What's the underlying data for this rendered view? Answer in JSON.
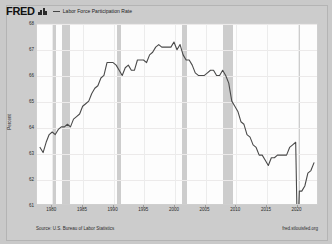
{
  "header": {
    "logo_text": "FRED",
    "logo_icon": "bar-chart-icon",
    "legend_label": "Labor Force Participation Rate"
  },
  "footer": {
    "source": "Source: U.S. Bureau of Labor Statistics",
    "url": "fred.stlouisfed.org"
  },
  "chart_data": {
    "type": "line",
    "title": "Labor Force Participation Rate",
    "xlabel": "",
    "ylabel": "Percent",
    "ylim": [
      61,
      68
    ],
    "xlim": [
      1977.5,
      2023.5
    ],
    "yticks": [
      68,
      67,
      66,
      65,
      64,
      63,
      62,
      61
    ],
    "xticks": [
      1980,
      1985,
      1990,
      1995,
      2000,
      2005,
      2010,
      2015,
      2020
    ],
    "grid": true,
    "legend_position": "top",
    "line_color": "#4a4a4a",
    "recession_color": "#c4c4c4",
    "recessions": [
      {
        "start": 1980.0,
        "end": 1980.6
      },
      {
        "start": 1981.5,
        "end": 1982.9
      },
      {
        "start": 1990.6,
        "end": 1991.2
      },
      {
        "start": 2001.2,
        "end": 2001.9
      },
      {
        "start": 2007.9,
        "end": 2009.5
      },
      {
        "start": 2020.1,
        "end": 2020.4
      }
    ],
    "x": [
      1978.0,
      1978.5,
      1979.0,
      1979.5,
      1980.0,
      1980.5,
      1981.0,
      1981.5,
      1982.0,
      1982.5,
      1983.0,
      1983.5,
      1984.0,
      1984.5,
      1985.0,
      1985.5,
      1986.0,
      1986.5,
      1987.0,
      1987.5,
      1988.0,
      1988.5,
      1989.0,
      1989.5,
      1990.0,
      1990.5,
      1991.0,
      1991.5,
      1992.0,
      1992.5,
      1993.0,
      1993.5,
      1994.0,
      1994.5,
      1995.0,
      1995.5,
      1996.0,
      1996.5,
      1997.0,
      1997.5,
      1998.0,
      1998.5,
      1999.0,
      1999.5,
      2000.0,
      2000.5,
      2001.0,
      2001.5,
      2002.0,
      2002.5,
      2003.0,
      2003.5,
      2004.0,
      2004.5,
      2005.0,
      2005.5,
      2006.0,
      2006.5,
      2007.0,
      2007.5,
      2008.0,
      2008.5,
      2009.0,
      2009.5,
      2010.0,
      2010.5,
      2011.0,
      2011.5,
      2012.0,
      2012.5,
      2013.0,
      2013.5,
      2014.0,
      2014.5,
      2015.0,
      2015.5,
      2016.0,
      2016.5,
      2017.0,
      2017.5,
      2018.0,
      2018.5,
      2019.0,
      2019.5,
      2020.0,
      2020.2,
      2020.4,
      2020.6,
      2021.0,
      2021.5,
      2022.0,
      2022.5,
      2023.0
    ],
    "values": [
      63.2,
      63.0,
      63.4,
      63.7,
      63.8,
      63.7,
      63.9,
      64.0,
      64.0,
      64.1,
      64.0,
      64.3,
      64.4,
      64.5,
      64.8,
      64.9,
      65.0,
      65.3,
      65.5,
      65.6,
      65.9,
      66.0,
      66.5,
      66.5,
      66.5,
      66.4,
      66.2,
      66.0,
      66.3,
      66.4,
      66.2,
      66.2,
      66.6,
      66.6,
      66.6,
      66.5,
      66.8,
      66.9,
      67.1,
      67.2,
      67.1,
      67.1,
      67.1,
      67.1,
      67.3,
      67.0,
      67.2,
      66.8,
      66.6,
      66.6,
      66.4,
      66.1,
      66.0,
      66.0,
      66.0,
      66.1,
      66.2,
      66.2,
      66.0,
      66.0,
      66.2,
      66.0,
      65.7,
      65.0,
      64.8,
      64.6,
      64.2,
      64.1,
      63.7,
      63.6,
      63.3,
      63.2,
      62.9,
      62.9,
      62.7,
      62.5,
      62.8,
      62.8,
      62.9,
      62.9,
      62.9,
      62.9,
      63.2,
      63.3,
      63.4,
      60.8,
      60.2,
      61.5,
      61.5,
      61.7,
      62.2,
      62.3,
      62.6
    ]
  }
}
